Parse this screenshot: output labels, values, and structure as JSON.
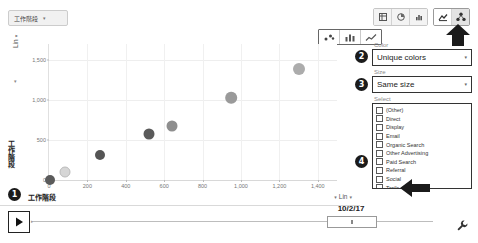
{
  "metric_dropdown": {
    "label": "工作階段",
    "caret": "▾"
  },
  "top_toolbar": {
    "view_buttons": [
      {
        "name": "table-view",
        "icon": "table-icon"
      },
      {
        "name": "pie-view",
        "icon": "pie-icon"
      },
      {
        "name": "bar-view",
        "icon": "bar-icon"
      }
    ],
    "mode_buttons": [
      {
        "name": "pivot-view",
        "icon": "pivot-icon",
        "active": false
      },
      {
        "name": "motion-chart-view",
        "icon": "motion-chart-icon",
        "active": true
      }
    ]
  },
  "chart_type_toolbar": [
    {
      "name": "scatter-chart-type",
      "icon": "scatter-icon",
      "active": false
    },
    {
      "name": "bar-chart-type",
      "icon": "bar-chart-icon",
      "active": false
    },
    {
      "name": "line-chart-type",
      "icon": "line-chart-icon",
      "active": false
    }
  ],
  "panel": {
    "color": {
      "label": "Color",
      "value": "Unique colors",
      "caret": "▾"
    },
    "size": {
      "label": "Size",
      "value": "Same size",
      "caret": "▾"
    },
    "select": {
      "label": "Select",
      "items": [
        {
          "label": "(Other)",
          "checked": false
        },
        {
          "label": "Direct",
          "checked": false
        },
        {
          "label": "Display",
          "checked": false
        },
        {
          "label": "Email",
          "checked": false
        },
        {
          "label": "Organic Search",
          "checked": false
        },
        {
          "label": "Other Advertising",
          "checked": false
        },
        {
          "label": "Paid Search",
          "checked": false
        },
        {
          "label": "Referral",
          "checked": false
        },
        {
          "label": "Social",
          "checked": false
        },
        {
          "label": "Trails",
          "checked": false
        }
      ]
    }
  },
  "badges": [
    {
      "number": "1"
    },
    {
      "number": "2"
    },
    {
      "number": "3"
    },
    {
      "number": "4"
    }
  ],
  "timeline": {
    "play_label": "▶",
    "date": "10/2/17"
  },
  "axis_scale": {
    "y": {
      "value": "Lin",
      "caret": "▾"
    },
    "x": {
      "value": "Lin",
      "caret": "▾"
    }
  },
  "chart_data": {
    "type": "scatter",
    "title": "",
    "xlabel": "工作階段",
    "ylabel": "工作階段",
    "xlim": [
      0,
      1500
    ],
    "ylim": [
      0,
      1700
    ],
    "grid": true,
    "legend": "none",
    "xticks": [
      "0",
      "200",
      "400",
      "600",
      "800",
      "1,000",
      "1,200",
      "1,400"
    ],
    "xtick_values": [
      0,
      200,
      400,
      600,
      800,
      1000,
      1200,
      1400
    ],
    "yticks": [
      "0",
      "500",
      "1,000",
      "1,500"
    ],
    "ytick_values": [
      0,
      500,
      1000,
      1500
    ],
    "points": [
      {
        "x": 5,
        "y": 5,
        "r": 5.0,
        "color": "#5b5b5b"
      },
      {
        "x": 85,
        "y": 95,
        "r": 4.5,
        "color": "#d6d6d6"
      },
      {
        "x": 265,
        "y": 315,
        "r": 5.0,
        "color": "#555555"
      },
      {
        "x": 520,
        "y": 580,
        "r": 5.5,
        "color": "#5a5a5a"
      },
      {
        "x": 640,
        "y": 680,
        "r": 5.5,
        "color": "#8e8e8e"
      },
      {
        "x": 950,
        "y": 1030,
        "r": 5.8,
        "color": "#9a9a9a"
      },
      {
        "x": 1300,
        "y": 1390,
        "r": 6.0,
        "color": "#acacac"
      }
    ]
  }
}
